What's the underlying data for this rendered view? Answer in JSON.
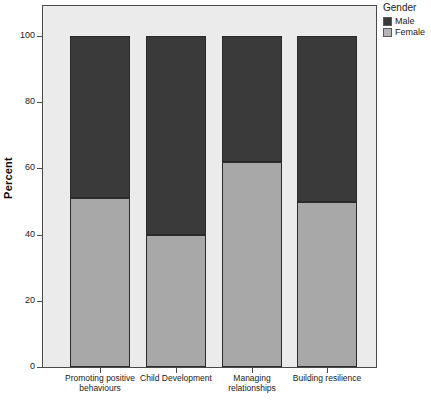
{
  "chart_data": {
    "type": "bar",
    "subtype": "stacked-100-percent",
    "title": "",
    "xlabel": "",
    "ylabel": "Percent",
    "ylim": [
      0,
      100
    ],
    "yticks": [
      0,
      20,
      40,
      60,
      80,
      100
    ],
    "ytick_labels": [
      "0",
      "20",
      "40",
      "60",
      "80",
      "100"
    ],
    "grid": false,
    "legend_position": "top-right",
    "legend_title": "Gender",
    "categories": [
      "Promoting positive\nbehaviours",
      "Child Development",
      "Managing\nrelationships",
      "Building resilience"
    ],
    "series": [
      {
        "name": "Female",
        "color": "#a8a8a8",
        "values": [
          51,
          40,
          62,
          50
        ]
      },
      {
        "name": "Male",
        "color": "#3a3a3a",
        "values": [
          49,
          60,
          38,
          50
        ]
      }
    ],
    "stack_order_bottom_to_top": [
      "Female",
      "Male"
    ]
  },
  "axis": {
    "y_title": "Percent",
    "y_tick_labels": [
      "100",
      "80",
      "60",
      "40",
      "20",
      "0"
    ],
    "x_caption": ""
  },
  "legend": {
    "title": "Gender",
    "items": [
      {
        "label": "Male",
        "color": "#3a3a3a"
      },
      {
        "label": "Female",
        "color": "#b4b4b4"
      }
    ]
  },
  "colors": {
    "male": "#3a3a3a",
    "female": "#a8a8a8",
    "plot_background": "#ebebeb",
    "page_background": "#ffffff",
    "axis": "#4a4a4a"
  }
}
